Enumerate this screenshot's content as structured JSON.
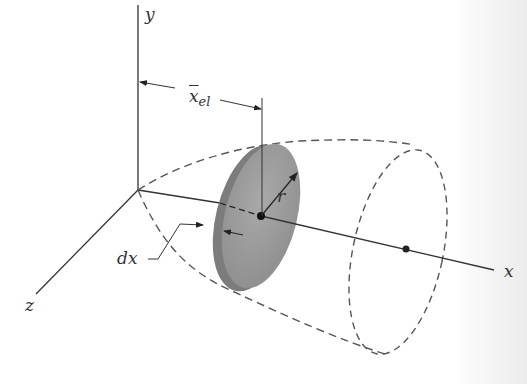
{
  "figure": {
    "axes": {
      "x_label": "x",
      "y_label": "y",
      "z_label": "z"
    },
    "labels": {
      "xbar_main": "x",
      "xbar_sub": "el",
      "radius": "r",
      "thickness": "dx"
    },
    "colors": {
      "line": "#333333",
      "dashed": "#555555",
      "disc_face": "#9a9a9a",
      "disc_rim": "#7c7c7c"
    }
  }
}
